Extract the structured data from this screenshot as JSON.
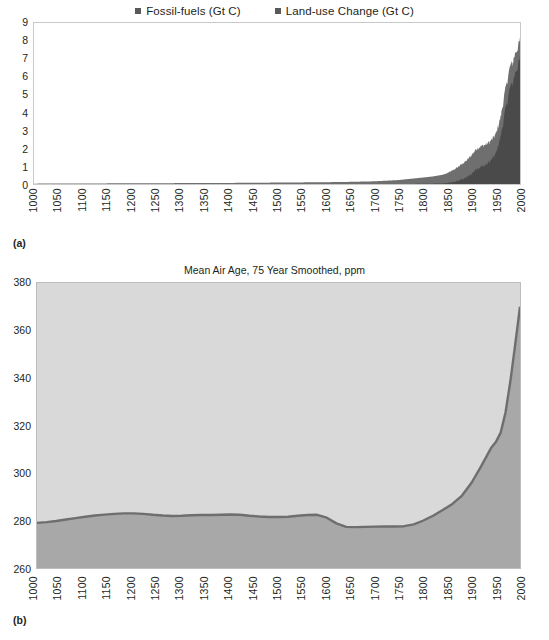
{
  "figure": {
    "panel_a_tag": "(a)",
    "panel_b_tag": "(b)"
  },
  "panel_a": {
    "legend": [
      {
        "label": "Fossil-fuels (Gt C)",
        "color": "#595959"
      },
      {
        "label": "Land-use Change (Gt C)",
        "color": "#595959"
      }
    ]
  },
  "panel_b": {
    "title": "Mean Air Age, 75 Year Smoothed, ppm"
  },
  "chart_data": [
    {
      "type": "area",
      "panel": "(a)",
      "title": "",
      "xlabel": "",
      "ylabel": "",
      "xlim": [
        1000,
        2000
      ],
      "ylim": [
        0,
        9
      ],
      "grid": false,
      "legend_position": "top-center",
      "xticks": [
        1000,
        1050,
        1100,
        1150,
        1200,
        1250,
        1300,
        1350,
        1400,
        1450,
        1500,
        1550,
        1600,
        1650,
        1700,
        1750,
        1800,
        1850,
        1900,
        1950,
        2000
      ],
      "yticks": [
        0,
        1,
        2,
        3,
        4,
        5,
        6,
        7,
        8,
        9
      ],
      "series": [
        {
          "name": "Fossil-fuels (Gt C)",
          "color": "#595959",
          "x": [
            1000,
            1100,
            1200,
            1300,
            1400,
            1500,
            1550,
            1600,
            1650,
            1700,
            1750,
            1800,
            1820,
            1840,
            1850,
            1860,
            1870,
            1880,
            1890,
            1900,
            1910,
            1920,
            1930,
            1940,
            1950,
            1960,
            1970,
            1980,
            1985,
            1990,
            1995,
            2000
          ],
          "values": [
            0,
            0,
            0,
            0,
            0,
            0,
            0,
            0,
            0,
            0,
            0,
            0.01,
            0.02,
            0.03,
            0.05,
            0.08,
            0.15,
            0.25,
            0.35,
            0.55,
            0.85,
            0.95,
            1.05,
            1.3,
            1.65,
            2.6,
            4.1,
            5.4,
            5.6,
            6.2,
            6.5,
            7.0
          ]
        },
        {
          "name": "Land-use Change (Gt C)",
          "color": "#595959",
          "x": [
            1000,
            1100,
            1200,
            1300,
            1400,
            1500,
            1550,
            1600,
            1650,
            1700,
            1750,
            1800,
            1820,
            1840,
            1850,
            1860,
            1870,
            1880,
            1890,
            1900,
            1910,
            1920,
            1930,
            1940,
            1950,
            1960,
            1970,
            1980,
            1985,
            1990,
            1995,
            2000
          ],
          "values": [
            0.02,
            0.03,
            0.04,
            0.05,
            0.06,
            0.08,
            0.09,
            0.1,
            0.12,
            0.15,
            0.22,
            0.35,
            0.4,
            0.48,
            0.55,
            0.65,
            0.75,
            0.85,
            0.95,
            1.05,
            1.1,
            1.15,
            1.15,
            1.1,
            1.1,
            1.1,
            1.15,
            1.2,
            1.15,
            1.1,
            1.05,
            1.05
          ]
        }
      ],
      "stacked": true,
      "peak_total": 8.0
    },
    {
      "type": "area",
      "panel": "(b)",
      "title": "Mean Air Age, 75 Year Smoothed, ppm",
      "xlabel": "",
      "ylabel": "ppm",
      "xlim": [
        1000,
        2000
      ],
      "ylim": [
        260,
        380
      ],
      "grid": false,
      "legend_position": "none",
      "xticks": [
        1000,
        1050,
        1100,
        1150,
        1200,
        1250,
        1300,
        1350,
        1400,
        1450,
        1500,
        1550,
        1600,
        1650,
        1700,
        1750,
        1800,
        1850,
        1900,
        1950,
        2000
      ],
      "yticks": [
        260,
        280,
        300,
        320,
        340,
        360,
        380
      ],
      "series": [
        {
          "name": "CO2 concentration",
          "color": "#6e6e6e",
          "x": [
            1000,
            1020,
            1040,
            1060,
            1080,
            1100,
            1120,
            1140,
            1160,
            1180,
            1200,
            1220,
            1240,
            1260,
            1280,
            1300,
            1320,
            1340,
            1360,
            1380,
            1400,
            1420,
            1440,
            1460,
            1480,
            1500,
            1520,
            1540,
            1560,
            1580,
            1600,
            1620,
            1640,
            1660,
            1680,
            1700,
            1720,
            1740,
            1760,
            1780,
            1800,
            1820,
            1840,
            1860,
            1880,
            1900,
            1920,
            1940,
            1950,
            1960,
            1970,
            1980,
            1990,
            2000
          ],
          "values": [
            279.0,
            279.3,
            279.8,
            280.4,
            281.0,
            281.6,
            282.1,
            282.5,
            282.8,
            283.0,
            283.0,
            282.8,
            282.4,
            282.1,
            281.9,
            282.0,
            282.2,
            282.3,
            282.3,
            282.4,
            282.5,
            282.4,
            282.0,
            281.7,
            281.5,
            281.5,
            281.6,
            282.0,
            282.3,
            282.4,
            281.2,
            278.8,
            277.3,
            277.2,
            277.3,
            277.4,
            277.5,
            277.5,
            277.6,
            278.4,
            280.0,
            282.0,
            284.4,
            287.0,
            290.5,
            296.0,
            303.0,
            310.5,
            313.0,
            317.0,
            325.5,
            338.5,
            354.0,
            370.0
          ]
        }
      ]
    }
  ]
}
